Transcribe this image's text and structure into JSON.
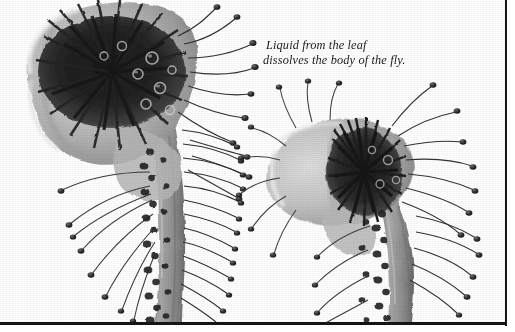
{
  "plate": {
    "kind": "photograph",
    "subject": "sundew-leaves-digesting-flies",
    "color_mode": "black-and-white",
    "background_color": "#ffffff",
    "border_color": "#151515",
    "borders_visible": "right, bottom"
  },
  "caption": {
    "line_1": "Liquid from the leaf",
    "line_2": "dissolves the body of the fly.",
    "style": "italic serif",
    "color": "#191919"
  },
  "figures": [
    {
      "name": "left-leaf",
      "description": "large curled sundew leaf with dark digested fly mass at center",
      "tone_dark": "#1d1d1d",
      "tone_mid": "#8b8b8b",
      "tone_light": "#c9c9c9"
    },
    {
      "name": "right-leaf",
      "description": "smaller oval sundew leaf with dark fan-shaped interior",
      "tone_dark": "#232323",
      "tone_mid": "#909090",
      "tone_light": "#cccccc"
    }
  ]
}
